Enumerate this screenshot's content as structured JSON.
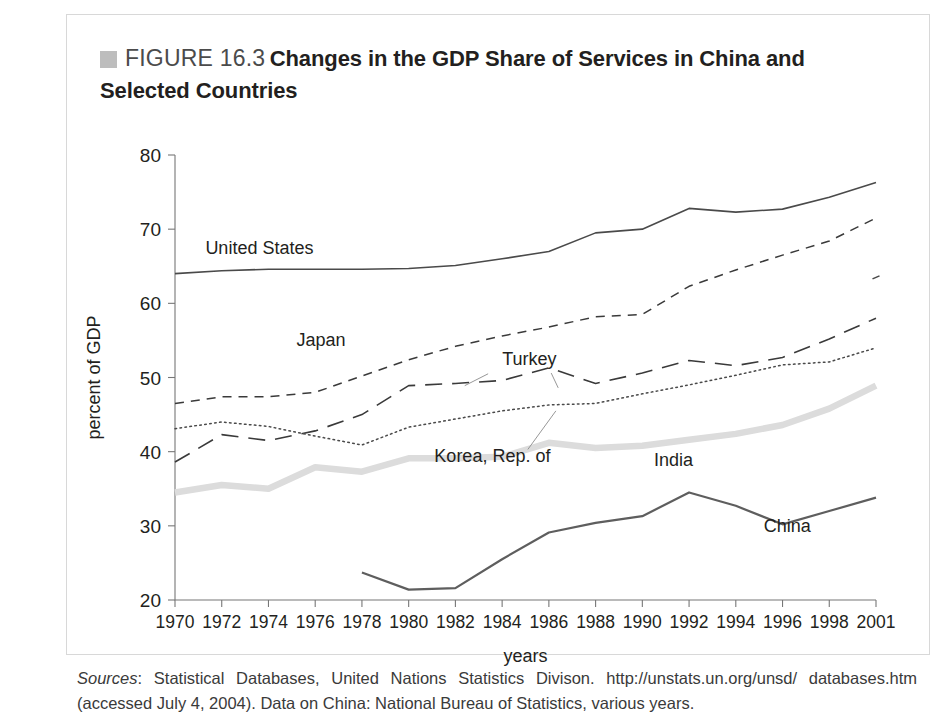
{
  "figure": {
    "swatch_color": "#bdbdbd",
    "number_label": "FIGURE 16.3",
    "title_line1": "Changes in the GDP Share of Services in China and",
    "title_line2": "Selected Countries"
  },
  "source": {
    "label": "Sources",
    "text": ": Statistical Databases, United Nations Statistics Divison. http://unstats.un.org/unsd/ databases.htm (accessed July 4, 2004). Data on China: National Bureau of Statistics, various years."
  },
  "chart_data": {
    "type": "line",
    "title": "Changes in the GDP Share of Services in China and Selected Countries",
    "xlabel": "years",
    "ylabel": "percent of GDP",
    "ylim": [
      20,
      80
    ],
    "yticks": [
      20,
      30,
      40,
      50,
      60,
      70,
      80
    ],
    "grid": false,
    "legend": "inline-labels",
    "categories": [
      "1970",
      "1972",
      "1974",
      "1976",
      "1978",
      "1980",
      "1982",
      "1984",
      "1986",
      "1988",
      "1990",
      "1992",
      "1994",
      "1996",
      "1998",
      "2001"
    ],
    "x": [
      1970,
      1972,
      1974,
      1976,
      1978,
      1980,
      1982,
      1984,
      1986,
      1988,
      1990,
      1992,
      1994,
      1996,
      1998,
      2001
    ],
    "series": [
      {
        "name": "United States",
        "color": "#4a4a4a",
        "style": "solid",
        "width": 1.6,
        "label_x": 1971.3,
        "label_y": 66.6,
        "values": [
          64.0,
          64.4,
          64.6,
          64.6,
          64.6,
          64.7,
          65.1,
          66.0,
          67.0,
          69.5,
          70.0,
          72.8,
          72.3,
          72.7,
          74.3,
          76.3
        ]
      },
      {
        "name": "Japan",
        "color": "#3a3a3a",
        "style": "dashed-short",
        "width": 1.5,
        "label_x": 1975.2,
        "label_y": 54.3,
        "values": [
          46.5,
          47.4,
          47.4,
          48.0,
          50.2,
          52.4,
          54.2,
          55.6,
          56.8,
          58.2,
          58.5,
          62.3,
          64.5,
          66.5,
          68.4,
          71.5
        ]
      },
      {
        "name": "Turkey",
        "color": "#3a3a3a",
        "style": "dashed-long",
        "width": 1.6,
        "label_x": 1984.0,
        "label_y": 51.7,
        "values": [
          38.6,
          42.3,
          41.5,
          42.8,
          45.0,
          48.9,
          49.2,
          49.6,
          51.3,
          49.2,
          50.6,
          52.3,
          51.6,
          52.7,
          55.2,
          58.0
        ]
      },
      {
        "name": "Korea, Rep. of",
        "color": "#4a4a4a",
        "style": "dotted",
        "width": 1.5,
        "label_x": 1981.1,
        "label_y": 38.6,
        "values": [
          43.1,
          44.0,
          43.4,
          42.1,
          40.9,
          43.3,
          44.4,
          45.5,
          46.3,
          46.5,
          47.8,
          49.0,
          50.3,
          51.7,
          52.1,
          54.0
        ]
      },
      {
        "name": "India",
        "color": "#dcdcdc",
        "style": "solid",
        "width": 6.5,
        "label_x": 1990.5,
        "label_y": 38.1,
        "values": [
          34.5,
          35.5,
          35.0,
          37.9,
          37.3,
          39.1,
          39.1,
          39.3,
          41.2,
          40.5,
          40.8,
          41.6,
          42.4,
          43.6,
          45.8,
          48.9
        ]
      },
      {
        "name": "China",
        "color": "#5e5e5e",
        "style": "solid",
        "width": 2.2,
        "label_x": 1995.2,
        "label_y": 29.2,
        "start_index": 4,
        "values": [
          null,
          null,
          null,
          null,
          23.7,
          21.4,
          21.6,
          25.5,
          29.1,
          30.4,
          31.3,
          34.5,
          32.7,
          30.2,
          32.0,
          33.8
        ]
      }
    ],
    "extra_points": [
      {
        "name": "turkey-2001-marker",
        "x": 2001,
        "y": 63.5
      }
    ]
  }
}
